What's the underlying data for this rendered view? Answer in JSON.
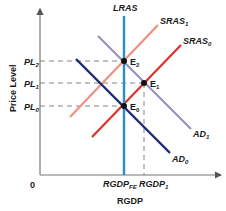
{
  "diagram": {
    "type": "AD-AS model",
    "axes": {
      "x_label": "RGDP",
      "y_label": "Price Level",
      "origin": "0"
    },
    "curves": {
      "lras": {
        "label": "LRAS",
        "color": "#2a8fc8"
      },
      "sras1": {
        "label": "SRAS",
        "sub": "1",
        "color": "#f0907f"
      },
      "sras0": {
        "label": "SRAS",
        "sub": "0",
        "color": "#e0302a"
      },
      "ad1": {
        "label": "AD",
        "sub": "1",
        "color": "#9a90c0"
      },
      "ad0": {
        "label": "AD",
        "sub": "0",
        "color": "#1e2a7a"
      }
    },
    "equilibria": {
      "e2": {
        "label": "E",
        "sub": "2"
      },
      "e1": {
        "label": "E",
        "sub": "1"
      },
      "e0": {
        "label": "E",
        "sub": "0"
      }
    },
    "y_ticks": {
      "pl2": {
        "label": "PL",
        "sub": "2"
      },
      "pl1": {
        "label": "PL",
        "sub": "1"
      },
      "pl0": {
        "label": "PL",
        "sub": "0"
      }
    },
    "x_ticks": {
      "fe": {
        "label": "RGDP",
        "sub": "FE"
      },
      "one": {
        "label": "RGDP",
        "sub": "1"
      }
    }
  }
}
